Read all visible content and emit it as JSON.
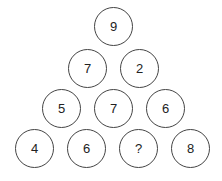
{
  "puzzle": {
    "rows": [
      [
        "9"
      ],
      [
        "7",
        "2"
      ],
      [
        "5",
        "7",
        "6"
      ],
      [
        "4",
        "6",
        "?",
        "8"
      ]
    ]
  }
}
